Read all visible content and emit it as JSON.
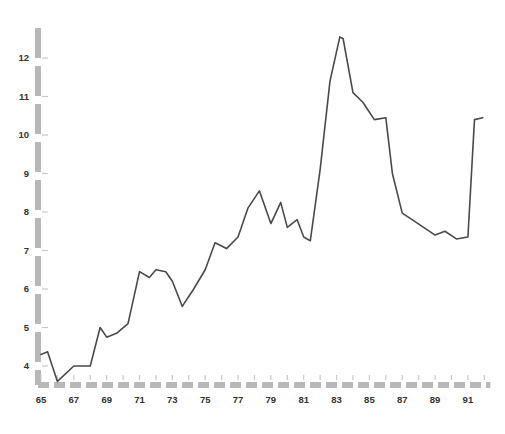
{
  "chart_data": {
    "type": "line",
    "title": "",
    "subtitle": "",
    "xlabel": "",
    "ylabel": "",
    "xlim": [
      64.6,
      92.6
    ],
    "ylim": [
      3.3,
      12.9
    ],
    "grid": false,
    "legend": null,
    "axis_style": "thick-dashed-gray",
    "series": [
      {
        "name": "series-1",
        "color": "#4a4a4a",
        "x": [
          65,
          65.4,
          66,
          67,
          68,
          68.6,
          69,
          69.6,
          70.3,
          71,
          71.6,
          72,
          72.6,
          73,
          73.6,
          74.3,
          75,
          75.6,
          76.3,
          77,
          77.6,
          78.3,
          79,
          79.6,
          80,
          80.6,
          81,
          81.4,
          82,
          82.6,
          83.2,
          83.4,
          84,
          84.6,
          85.3,
          86,
          86.4,
          87,
          87.6,
          88.3,
          89,
          89.6,
          90.3,
          91,
          91.4,
          91.9
        ],
        "y": [
          4.3,
          4.37,
          3.6,
          4.0,
          4.0,
          5.0,
          4.75,
          4.85,
          5.1,
          6.45,
          6.3,
          6.5,
          6.45,
          6.2,
          5.55,
          6.0,
          6.5,
          7.2,
          7.05,
          7.35,
          8.1,
          8.55,
          7.7,
          8.25,
          7.6,
          7.8,
          7.35,
          7.25,
          9.1,
          11.4,
          12.55,
          12.5,
          11.1,
          10.85,
          10.4,
          10.45,
          9.0,
          7.97,
          7.8,
          7.6,
          7.4,
          7.5,
          7.3,
          7.35,
          10.4,
          10.45
        ]
      }
    ],
    "y_axis": {
      "ticks": [
        4,
        5,
        6,
        7,
        8,
        9,
        10,
        11,
        12
      ],
      "tick_labels": [
        "4",
        "5",
        "6",
        "7",
        "8",
        "9",
        "10",
        "11",
        "12"
      ]
    },
    "x_axis": {
      "ticks": [
        65,
        66,
        67,
        68,
        69,
        70,
        71,
        72,
        73,
        74,
        75,
        76,
        77,
        78,
        79,
        80,
        81,
        82,
        83,
        84,
        85,
        86,
        87,
        88,
        89,
        90,
        91,
        92
      ],
      "labeled_ticks": [
        65,
        67,
        69,
        71,
        73,
        75,
        77,
        79,
        81,
        83,
        85,
        87,
        89,
        91
      ],
      "tick_labels": [
        "65",
        "67",
        "69",
        "71",
        "73",
        "75",
        "77",
        "79",
        "81",
        "83",
        "85",
        "87",
        "89",
        "91"
      ]
    },
    "colors": {
      "line": "#4a4a4a",
      "axis": "#b8b8b8",
      "tick_mark": "#c8c8c8",
      "text": "#333333",
      "background": "#ffffff"
    }
  }
}
